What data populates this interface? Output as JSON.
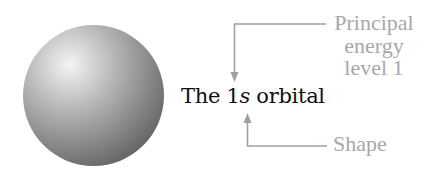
{
  "diagram": {
    "title_prefix": "The 1",
    "title_italic": "s",
    "title_suffix": " orbital",
    "annotations": {
      "principal": [
        "Principal",
        "energy",
        "level 1"
      ],
      "shape": "Shape"
    },
    "colors": {
      "annotation_text": "#a8a8a8",
      "arrow": "#a0a0a0",
      "label_text": "#111111"
    },
    "figure": "sphere representing 1s orbital"
  }
}
